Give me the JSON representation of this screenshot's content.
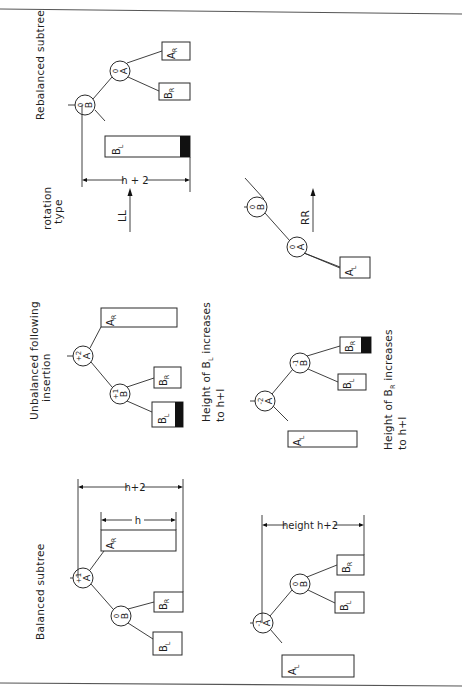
{
  "figure": {
    "rotation_type_label_line1": "rotation",
    "rotation_type_label_line2": "type",
    "columns": {
      "balanced": "Balanced   subtree",
      "unbalanced_line1": "Unbalanced   following",
      "unbalanced_line2": "insertion",
      "rebalanced": "Rebalanced   subtree"
    },
    "ll_case": {
      "rotation": "LL",
      "balanced": {
        "nodes": [
          {
            "id": "A",
            "balance": "+1"
          },
          {
            "id": "B",
            "balance": "0"
          }
        ],
        "subtrees": [
          {
            "label": "B",
            "sub": "L"
          },
          {
            "label": "B",
            "sub": "R"
          },
          {
            "label": "A",
            "sub": "R"
          }
        ],
        "dim_outer": "h+2",
        "dim_inner": "h"
      },
      "unbalanced": {
        "nodes": [
          {
            "id": "A",
            "balance": "+2"
          },
          {
            "id": "B",
            "balance": "+1"
          }
        ],
        "subtrees": [
          {
            "label": "B",
            "sub": "L",
            "grown": true
          },
          {
            "label": "B",
            "sub": "R"
          },
          {
            "label": "A",
            "sub": "R"
          }
        ],
        "caption_line1_a": "Height  of  B",
        "caption_line1_sub": "L",
        "caption_line1_b": "  increases",
        "caption_line2": "to  h+I"
      },
      "rebalanced": {
        "nodes": [
          {
            "id": "B",
            "balance": "0"
          },
          {
            "id": "A",
            "balance": "0"
          }
        ],
        "subtrees": [
          {
            "label": "B",
            "sub": "L",
            "grown": true
          },
          {
            "label": "B",
            "sub": "R"
          },
          {
            "label": "A",
            "sub": "R"
          }
        ],
        "dim": "h + 2"
      }
    },
    "rr_case": {
      "rotation": "RR",
      "balanced": {
        "nodes": [
          {
            "id": "A",
            "balance": "-1"
          },
          {
            "id": "B",
            "balance": "0"
          }
        ],
        "subtrees": [
          {
            "label": "A",
            "sub": "L"
          },
          {
            "label": "B",
            "sub": "L"
          },
          {
            "label": "B",
            "sub": "R"
          }
        ],
        "dim": "height  h+2"
      },
      "unbalanced": {
        "nodes": [
          {
            "id": "A",
            "balance": "-2"
          },
          {
            "id": "B",
            "balance": "-1"
          }
        ],
        "subtrees": [
          {
            "label": "A",
            "sub": "L"
          },
          {
            "label": "B",
            "sub": "L"
          },
          {
            "label": "B",
            "sub": "R",
            "grown": true
          }
        ],
        "caption_line1_a": "Height  of  B",
        "caption_line1_sub": "R",
        "caption_line1_b": "   increases",
        "caption_line2": "to  h+I"
      },
      "rebalanced": {
        "nodes": [
          {
            "id": "B",
            "balance": "0"
          },
          {
            "id": "A",
            "balance": "0"
          }
        ],
        "subtrees": [
          {
            "label": "A",
            "sub": "L"
          },
          {
            "label": "B",
            "sub": "L"
          },
          {
            "label": "B",
            "sub": "R",
            "grown": true
          }
        ],
        "dim": "height  h+2",
        "caption_line1": "Height  of  subtrees  of  B",
        "caption_line2": "remain  h+I"
      }
    }
  }
}
